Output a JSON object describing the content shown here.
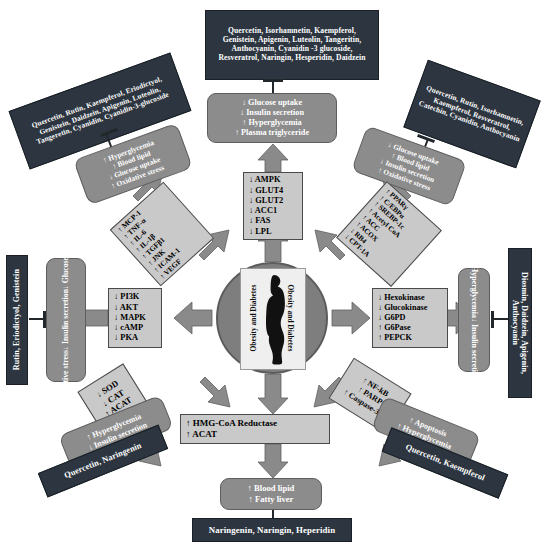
{
  "diagram": {
    "center": {
      "label_left": "Obesity  and  Diabetes",
      "label_right": "Obesity  and  Diabetes",
      "figure": "obese-human-silhouette"
    },
    "colors": {
      "phytochemical_box": "#2d3640",
      "outcome_box": "#8c8c8c",
      "marker_box": "#c9c9c9",
      "arrow": "#8a8a8a",
      "center_disc": "#7e7e7e"
    },
    "nodes": {
      "top_phyto": "Quercetin, Isorhamnetin, Kaempferol, Genistein, Apigenin, Luteolin, Tangeritin, Anthocyanin, Cyanidin -3 glucoside, Resveratrol, Naringin, Hesperidin, Daidzein",
      "top_outcome": [
        "↓ Glucose uptake",
        "↓ Insulin secretion",
        "↑ Hyperglycemia",
        "↑ Plasma triglyceride"
      ],
      "top_markers": [
        "↓ AMPK",
        "↓ GLUT4",
        "↓ GLUT2",
        "↓ ACC1",
        "↓ FAS",
        "↓ LPL"
      ],
      "topleft_phyto": "Quercetin, Rutin, Kaempferol, Eriodictyol, Genistein, Daidzein, Apigenin, Luteolin, Tangeretin, Cyanidin, Cyanidin-3-glucoside",
      "topleft_outcome": [
        "↑ Hyperglycemia",
        "↑ Blood lipid",
        "↓ Glucose uptake",
        "↑ Oxidative stress"
      ],
      "topleft_markers": [
        "↑ MCP-1",
        "↑ TNF-α",
        "↑ IL-6",
        "↑ IL-1β",
        "↑ TGFβ1",
        "↑ JNK",
        "↑ ICAM-1",
        "↑ VEGF"
      ],
      "topright_phyto": "Quercetin, Rutin, Isorhamnetin, Kaempferol, Resveratrol, Catechin, Cyanidin, Anthocyanin",
      "topright_outcome": [
        "↓ Glucose uptake",
        "↑ Blood lipid",
        "↓ Insulin secretion",
        "↑ Oxidative stress"
      ],
      "topright_markers": [
        "↑ PPARγ",
        "↑ C/EBPα",
        "↑ SREBP-1c",
        "↑ Acetyl CoA",
        "↑ ACC",
        "↑ ACOX",
        "↓ RB4",
        "↓ CPT-1A"
      ],
      "left_phyto": "Rutin, Eriodictyol, Genistein",
      "left_outcome": [
        "↓ Glucose uptake",
        "↓ Insulin secretion",
        "↑ Oxidative stress"
      ],
      "left_markers": [
        "↓ PI3K",
        "↓ AKT",
        "↓ MAPK",
        "↓ cAMP",
        "↓ PKA"
      ],
      "right_phyto": "Diosmin, Daidzein, Apigenin, Anthocyanin",
      "right_outcome": [
        "↑ Hyperglycemia",
        "↓ Insulin secretion"
      ],
      "right_markers": [
        "↓ Hexokinase",
        "↓ Glucokinase",
        "↓ G6PD",
        "↑ G6Pase",
        "↑ PEPCK"
      ],
      "bottomleft_phyto": "Quercetin, Naringenin",
      "bottomleft_outcome": [
        "↑ Hyperglycemia",
        "↓ Insulin secretion"
      ],
      "bottomleft_markers": [
        "↓ SOD",
        "↓ CAT",
        "↑ ACAT"
      ],
      "bottomright_phyto": "Quercetin, Kaempferol",
      "bottomright_outcome": [
        "↑ Apoptosis",
        "↑ Hyperglycemia"
      ],
      "bottomright_markers": [
        "↑ NF-kB",
        "↑ PARP",
        "↑ Caspase-3, 9"
      ],
      "bottom_markers": [
        "↑ HMG-CoA Reductase",
        "↑ ACAT"
      ],
      "bottom_outcome": [
        "↑ Blood lipid",
        "↑ Fatty liver"
      ],
      "bottom_phyto": "Naringenin, Naringin, Heperidin"
    }
  }
}
